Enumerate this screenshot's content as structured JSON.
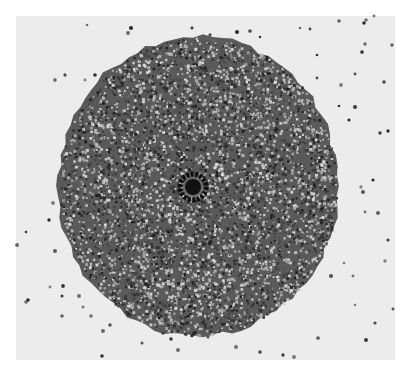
{
  "image": {
    "description": "Grayscale micrograph of a circular disc of densely packed particles with a dark ring at its center, surrounded by scattered isolated particles",
    "background_color": "#ececec",
    "disc": {
      "cx": 198,
      "cy": 186,
      "rx": 140,
      "ry": 150,
      "color": "#5a5a5a"
    },
    "center_ring": {
      "cx": 193,
      "cy": 187,
      "outer_r": 16,
      "core_r": 8,
      "color": "#111111"
    },
    "scattered_particles": [
      [
        87,
        25
      ],
      [
        128,
        33
      ],
      [
        131,
        28
      ],
      [
        192,
        28
      ],
      [
        210,
        35
      ],
      [
        237,
        32
      ],
      [
        250,
        31
      ],
      [
        260,
        37
      ],
      [
        300,
        28
      ],
      [
        310,
        29
      ],
      [
        339,
        21
      ],
      [
        364,
        23
      ],
      [
        366,
        20
      ],
      [
        374,
        16
      ],
      [
        392,
        45
      ],
      [
        365,
        44
      ],
      [
        362,
        52
      ],
      [
        317,
        55
      ],
      [
        355,
        74
      ],
      [
        317,
        78
      ],
      [
        341,
        85
      ],
      [
        384,
        82
      ],
      [
        55,
        80
      ],
      [
        65,
        75
      ],
      [
        85,
        80
      ],
      [
        95,
        75
      ],
      [
        339,
        106
      ],
      [
        355,
        107
      ],
      [
        349,
        120
      ],
      [
        380,
        133
      ],
      [
        388,
        131
      ],
      [
        373,
        180
      ],
      [
        361,
        187
      ],
      [
        363,
        192
      ],
      [
        365,
        212
      ],
      [
        378,
        213
      ],
      [
        388,
        240
      ],
      [
        385,
        261
      ],
      [
        344,
        263
      ],
      [
        331,
        276
      ],
      [
        353,
        276
      ],
      [
        53,
        203
      ],
      [
        26,
        232
      ],
      [
        17,
        245
      ],
      [
        49,
        220
      ],
      [
        55,
        251
      ],
      [
        50,
        287
      ],
      [
        63,
        286
      ],
      [
        79,
        296
      ],
      [
        83,
        307
      ],
      [
        62,
        296
      ],
      [
        26,
        302
      ],
      [
        62,
        316
      ],
      [
        91,
        316
      ],
      [
        110,
        325
      ],
      [
        103,
        331
      ],
      [
        102,
        356
      ],
      [
        142,
        343
      ],
      [
        178,
        350
      ],
      [
        163,
        333
      ],
      [
        171,
        339
      ],
      [
        208,
        337
      ],
      [
        236,
        347
      ],
      [
        260,
        352
      ],
      [
        283,
        355
      ],
      [
        294,
        357
      ],
      [
        318,
        338
      ],
      [
        355,
        305
      ],
      [
        375,
        323
      ],
      [
        393,
        309
      ],
      [
        366,
        340
      ],
      [
        28,
        300
      ]
    ]
  }
}
